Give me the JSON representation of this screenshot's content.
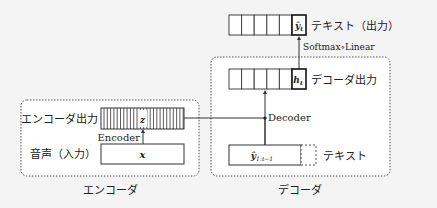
{
  "encoder": {
    "group_label": "エンコーダ",
    "output_label": "エンコーダ出力",
    "output_symbol": "z",
    "input_label": "音声（入力）",
    "input_symbol": "x",
    "arrow_label": "Encoder"
  },
  "decoder": {
    "group_label": "デコーダ",
    "output_label": "デコーダ出力",
    "output_symbol": "h",
    "output_subscript": "t",
    "input_label": "テキスト",
    "input_symbol": "ŷ",
    "input_subscript": "1:t−1",
    "arrow_label": "Decoder",
    "projection_label": "Softmax∘Linear",
    "final_label": "テキスト（出力）",
    "final_symbol": "ŷ",
    "final_subscript": "t"
  }
}
